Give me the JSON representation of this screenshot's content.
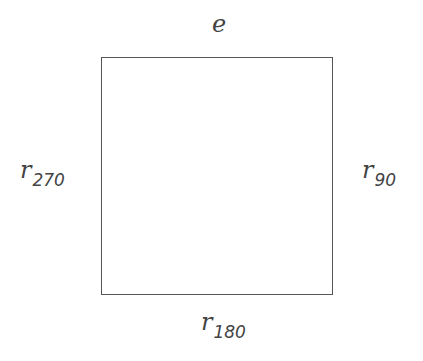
{
  "diagram": {
    "shape": "square",
    "stroke_color": "#555555",
    "text_color": "#444444",
    "labels": {
      "top": {
        "base": "e",
        "sub": ""
      },
      "right": {
        "base": "r",
        "sub": "90"
      },
      "bottom": {
        "base": "r",
        "sub": "180"
      },
      "left": {
        "base": "r",
        "sub": "270"
      }
    }
  }
}
